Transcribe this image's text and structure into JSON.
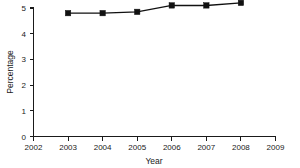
{
  "chart_data": {
    "type": "line",
    "title": "",
    "xlabel": "Year",
    "ylabel": "Percentage",
    "x": [
      2003,
      2004,
      2005,
      2006,
      2007,
      2008
    ],
    "values": [
      4.8,
      4.8,
      4.85,
      5.1,
      5.1,
      5.2
    ],
    "series": [
      {
        "name": "Percentage",
        "values": [
          4.8,
          4.8,
          4.85,
          5.1,
          5.1,
          5.2
        ]
      }
    ],
    "xlim": [
      2002,
      2009
    ],
    "ylim": [
      0,
      5
    ],
    "x_ticks": [
      2002,
      2003,
      2004,
      2005,
      2006,
      2007,
      2008,
      2009
    ],
    "x_tick_labels": [
      "2002",
      "2003",
      "2004",
      "2005",
      "2006",
      "2007",
      "2008",
      "2009"
    ],
    "y_ticks": [
      0,
      1,
      2,
      3,
      4,
      5
    ],
    "y_tick_labels": [
      "0",
      "1",
      "2",
      "3",
      "4",
      "5"
    ],
    "grid": false,
    "legend": false,
    "legend_position": "none",
    "marker": "square",
    "line_color": "#111111",
    "marker_color": "#111111",
    "background_color": "#ffffff"
  },
  "axes": {
    "x_title": "Year",
    "y_title": "Percentage",
    "x_tick_0": "2002",
    "x_tick_1": "2003",
    "x_tick_2": "2004",
    "x_tick_3": "2005",
    "x_tick_4": "2006",
    "x_tick_5": "2007",
    "x_tick_6": "2008",
    "x_tick_7": "2009",
    "y_tick_0": "0",
    "y_tick_1": "1",
    "y_tick_2": "2",
    "y_tick_3": "3",
    "y_tick_4": "4",
    "y_tick_5": "5"
  }
}
